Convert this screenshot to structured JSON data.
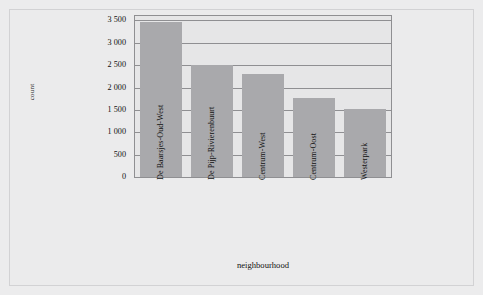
{
  "chart_data": {
    "type": "bar",
    "title": "",
    "subtitle": "",
    "xlabel": "neighbourhood",
    "ylabel": "count",
    "categories": [
      "De Baarsjes-Oud-West",
      "De Pijp-Rivierenbuurt",
      "Centrum-West",
      "Centrum-Oost",
      "Westerpark"
    ],
    "values": [
      3460,
      2510,
      2310,
      1770,
      1510
    ],
    "ylim": [
      0,
      3600
    ],
    "ytick_values": [
      0,
      500,
      1000,
      1500,
      2000,
      2500,
      3000,
      3500
    ],
    "ytick_labels": [
      "0",
      "500",
      "1 000",
      "1 500",
      "2 000",
      "2 500",
      "3 000",
      "3 500"
    ],
    "grid": "horizontal",
    "legend": "none",
    "bar_color": "#a9a9ac",
    "panel_color": "#e6e6e7",
    "grid_color": "#8f8f92",
    "xtick_rotation": 90
  }
}
